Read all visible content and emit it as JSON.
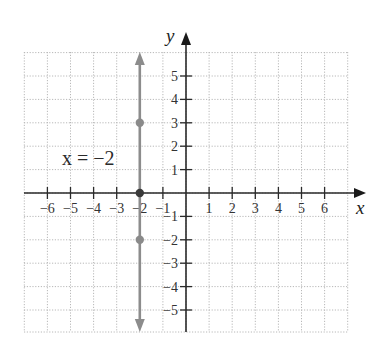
{
  "chart_data": {
    "type": "line",
    "title": "",
    "xlabel": "x",
    "ylabel": "y",
    "xlim": [
      -7,
      7
    ],
    "ylim": [
      -6,
      6
    ],
    "grid": true,
    "x_ticks": [
      -6,
      -5,
      -4,
      -3,
      -2,
      -1,
      1,
      2,
      3,
      4,
      5,
      6
    ],
    "y_ticks": [
      5,
      4,
      3,
      2,
      1,
      -1,
      -2,
      -3,
      -4,
      -5
    ],
    "x_tick_labels": [
      "−6",
      "−5",
      "−4",
      "−3",
      "−2",
      "−1",
      "1",
      "2",
      "3",
      "4",
      "5",
      "6"
    ],
    "y_tick_labels": [
      "5",
      "4",
      "3",
      "2",
      "1",
      "−1",
      "−2",
      "−3",
      "−4",
      "−5"
    ],
    "series": [
      {
        "name": "x = −2",
        "kind": "vertical-line",
        "x": -2,
        "color": "#8c8c8c",
        "arrows": "both",
        "points": [
          {
            "x": -2,
            "y": 3
          },
          {
            "x": -2,
            "y": 0
          },
          {
            "x": -2,
            "y": -2
          }
        ]
      }
    ],
    "annotations": [
      {
        "text": "x = −2",
        "x": -5.5,
        "y": 2
      }
    ]
  },
  "labels": {
    "x_axis": "x",
    "y_axis": "y",
    "equation": "x = −2"
  }
}
